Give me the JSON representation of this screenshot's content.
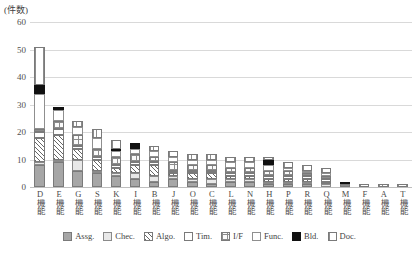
{
  "axis": {
    "unit_caption": "(件数)",
    "y_ticks": [
      "0",
      "10",
      "20",
      "30",
      "40",
      "50",
      "60"
    ]
  },
  "legend": {
    "items": [
      {
        "label": "Assg.",
        "key": "assg",
        "swatch": "solid-grey-swatch"
      },
      {
        "label": "Chec.",
        "key": "chec",
        "swatch": "light-grey-swatch"
      },
      {
        "label": "Algo.",
        "key": "algo",
        "swatch": "diagonal-hatch-swatch"
      },
      {
        "label": "Tim.",
        "key": "tim",
        "swatch": "white-swatch"
      },
      {
        "label": "I/F",
        "key": "if",
        "swatch": "cross-grid-swatch"
      },
      {
        "label": "Func.",
        "key": "func",
        "swatch": "white-outline-swatch"
      },
      {
        "label": "Bld.",
        "key": "bld",
        "swatch": "solid-black-swatch"
      },
      {
        "label": "Doc.",
        "key": "doc",
        "swatch": "vertical-stripe-swatch"
      }
    ]
  },
  "chart_data": {
    "type": "bar",
    "stacked": true,
    "title": "",
    "xlabel": "",
    "ylabel": "(件数)",
    "ylim": [
      0,
      60
    ],
    "ytick_step": 10,
    "grid": true,
    "legend_position": "bottom",
    "categories": [
      "D機能",
      "E機能",
      "G機能",
      "S機能",
      "K機能",
      "I機能",
      "B機能",
      "J機能",
      "O機能",
      "C機能",
      "L機能",
      "N機能",
      "H機能",
      "P機能",
      "R機能",
      "Q機能",
      "M機能",
      "F機能",
      "A機能",
      "T機能"
    ],
    "series": [
      {
        "name": "Assg.",
        "values": [
          8,
          9,
          6,
          5,
          4,
          3,
          2,
          3,
          2,
          1,
          2,
          2,
          1,
          1,
          1,
          0,
          0,
          0,
          0,
          0
        ]
      },
      {
        "name": "Chec.",
        "values": [
          1,
          1,
          4,
          1,
          1,
          2,
          2,
          1,
          1,
          2,
          1,
          1,
          1,
          1,
          1,
          1,
          0,
          0,
          0,
          0
        ]
      },
      {
        "name": "Algo.",
        "values": [
          9,
          9,
          4,
          4,
          2,
          3,
          4,
          1,
          2,
          2,
          1,
          1,
          1,
          1,
          1,
          1,
          0,
          0,
          0,
          0
        ]
      },
      {
        "name": "Tim.",
        "values": [
          2,
          2,
          1,
          1,
          1,
          1,
          1,
          1,
          1,
          1,
          1,
          1,
          1,
          1,
          1,
          1,
          0,
          0,
          0,
          0
        ]
      },
      {
        "name": "I/F",
        "values": [
          1,
          3,
          4,
          3,
          3,
          3,
          2,
          3,
          2,
          2,
          2,
          2,
          2,
          2,
          1,
          1,
          1,
          0,
          0,
          0
        ]
      },
      {
        "name": "Func.",
        "values": [
          13,
          4,
          3,
          4,
          2,
          2,
          2,
          2,
          2,
          2,
          2,
          2,
          2,
          1,
          1,
          1,
          0,
          0,
          0,
          0
        ]
      },
      {
        "name": "Bld.",
        "values": [
          3,
          1,
          0,
          0,
          1,
          2,
          0,
          0,
          0,
          0,
          0,
          0,
          2,
          0,
          0,
          0,
          1,
          0,
          0,
          0
        ]
      },
      {
        "name": "Doc.",
        "values": [
          14,
          0,
          2,
          3,
          3,
          0,
          2,
          2,
          2,
          2,
          2,
          2,
          1,
          2,
          2,
          2,
          0,
          1,
          1,
          1
        ]
      }
    ],
    "totals": [
      51,
      29,
      24,
      21,
      17,
      16,
      15,
      13,
      12,
      12,
      11,
      11,
      11,
      9,
      8,
      7,
      2,
      1,
      1,
      1
    ]
  }
}
